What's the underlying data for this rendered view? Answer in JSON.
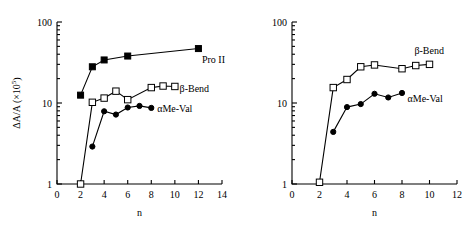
{
  "figure": {
    "background": "#ffffff",
    "line_color": "#000000",
    "panels": [
      "left",
      "right"
    ]
  },
  "chart_data": [
    {
      "panel": "left",
      "type": "line",
      "title": "",
      "xlabel": "n",
      "ylabel": "ΔA/A (×10⁵)",
      "xlim": [
        0,
        14
      ],
      "ylim": [
        1,
        100
      ],
      "yscale": "log",
      "xticks": [
        0,
        2,
        4,
        6,
        8,
        10,
        12,
        14
      ],
      "xticklabels": [
        "0",
        "2",
        "4",
        "6",
        "8",
        "10",
        "12",
        "14"
      ],
      "yticks": [
        1,
        10,
        100
      ],
      "yticklabels": [
        "1",
        "10",
        "100"
      ],
      "grid": false,
      "legend": "inline-annotations",
      "series": [
        {
          "name": "Pro II",
          "marker": "filled-square",
          "x": [
            2,
            3,
            4,
            6,
            12
          ],
          "values": [
            12.5,
            28,
            34,
            38,
            47
          ]
        },
        {
          "name": "β-Bend",
          "marker": "open-square",
          "x": [
            2,
            3,
            4,
            5,
            6,
            8,
            9,
            10
          ],
          "values": [
            1.0,
            10.2,
            11.5,
            14.0,
            11.0,
            15.5,
            16.2,
            16.0
          ]
        },
        {
          "name": "αMe-Val",
          "marker": "filled-circle",
          "x": [
            3,
            4,
            5,
            6,
            7,
            8
          ],
          "values": [
            2.9,
            7.9,
            7.2,
            8.8,
            9.2,
            8.7
          ]
        }
      ],
      "annotations": [
        {
          "text": "Pro II",
          "x": 12.3,
          "y": 34.0
        },
        {
          "text": "β-Bend",
          "x": 10.4,
          "y": 15.0
        },
        {
          "text": "αMe-Val",
          "x": 8.5,
          "y": 8.6
        }
      ]
    },
    {
      "panel": "right",
      "type": "line",
      "title": "",
      "xlabel": "n",
      "ylabel": "",
      "xlim": [
        0,
        12
      ],
      "ylim": [
        1,
        100
      ],
      "yscale": "log",
      "xticks": [
        0,
        2,
        4,
        6,
        8,
        10,
        12
      ],
      "xticklabels": [
        "0",
        "2",
        "4",
        "6",
        "8",
        "10",
        "12"
      ],
      "yticks": [
        1,
        10,
        100
      ],
      "yticklabels": [
        "1",
        "10",
        "100"
      ],
      "grid": false,
      "legend": "inline-annotations",
      "series": [
        {
          "name": "β-Bend",
          "marker": "open-square",
          "x": [
            2,
            3,
            4,
            5,
            6,
            8,
            9,
            10
          ],
          "values": [
            1.05,
            15.5,
            19.5,
            28.0,
            29.5,
            26.5,
            29.0,
            30.0
          ]
        },
        {
          "name": "αMe-Val",
          "marker": "filled-circle",
          "x": [
            3,
            4,
            5,
            6,
            7,
            8
          ],
          "values": [
            4.4,
            8.9,
            9.7,
            13.0,
            11.7,
            13.3
          ]
        }
      ],
      "annotations": [
        {
          "text": "β-Bend",
          "x": 8.9,
          "y": 44.0
        },
        {
          "text": "αMe-Val",
          "x": 8.4,
          "y": 11.3
        }
      ]
    }
  ]
}
